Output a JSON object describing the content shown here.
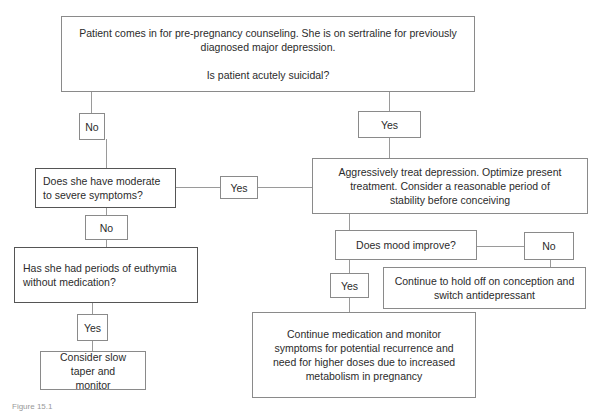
{
  "flowchart": {
    "start": {
      "line1": "Patient comes in for pre-pregnancy counseling. She is on sertraline for previously diagnosed major depression.",
      "line2": "Is patient acutely suicidal?"
    },
    "suicidal_no": "No",
    "suicidal_yes": "Yes",
    "moderate_question": "Does she have moderate to severe symptoms?",
    "moderate_yes": "Yes",
    "moderate_no": "No",
    "aggressive_treat": "Aggressively treat depression. Optimize present treatment. Consider a reasonable period of stability before conceiving",
    "mood_question": "Does mood improve?",
    "mood_no": "No",
    "mood_yes": "Yes",
    "switch_antidepressant": "Continue to hold off on conception and switch antidepressant",
    "euthymia_question": "Has she had periods of euthymia without medication?",
    "euthymia_yes": "Yes",
    "slow_taper": "Consider slow taper and monitor",
    "continue_medication": "Continue medication and monitor symptoms for potential recurrence and need for higher doses due to increased metabolism in pregnancy"
  },
  "caption": "Figure 15.1"
}
